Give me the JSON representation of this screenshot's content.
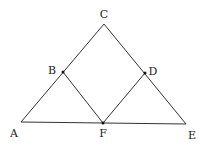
{
  "diagram": {
    "type": "geometry",
    "stroke_color": "#333333",
    "points": {
      "A": {
        "x": 21,
        "y": 122,
        "label": "A",
        "lx": 14,
        "ly": 137
      },
      "C": {
        "x": 104,
        "y": 24,
        "label": "C",
        "lx": 104,
        "ly": 18
      },
      "E": {
        "x": 186,
        "y": 124,
        "label": "E",
        "lx": 192,
        "ly": 139
      },
      "F": {
        "x": 103,
        "y": 123,
        "label": "F",
        "lx": 103,
        "ly": 137
      },
      "B": {
        "x": 63,
        "y": 72,
        "label": "B",
        "lx": 52,
        "ly": 74
      },
      "D": {
        "x": 145,
        "y": 73,
        "label": "D",
        "lx": 153,
        "ly": 75
      }
    },
    "segments": [
      [
        "A",
        "C"
      ],
      [
        "C",
        "E"
      ],
      [
        "A",
        "E"
      ],
      [
        "B",
        "F"
      ],
      [
        "D",
        "F"
      ]
    ],
    "marked_points": [
      "B",
      "D",
      "F"
    ]
  }
}
